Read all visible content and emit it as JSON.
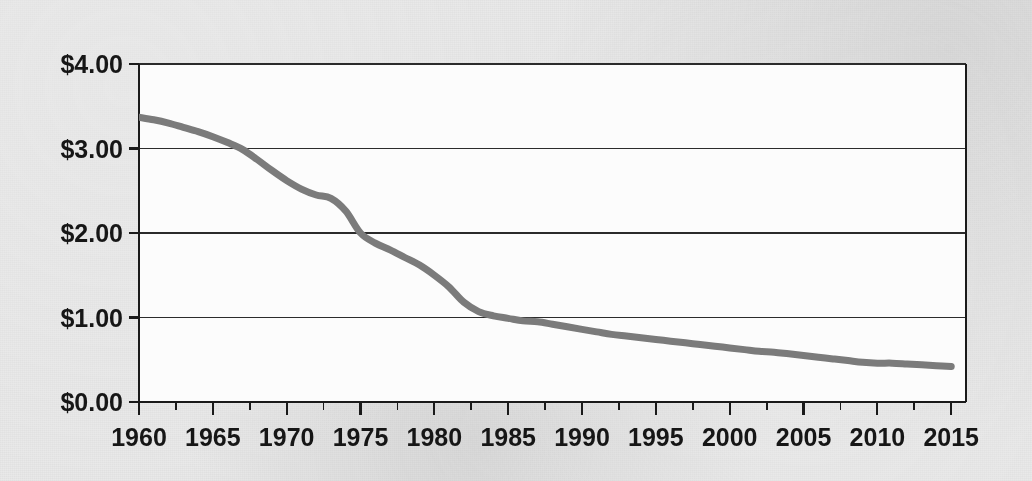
{
  "figure": {
    "background_color": "#e9e9e9",
    "plot_background_color": "#fcfcfc",
    "paper_note": "scanned-book-page"
  },
  "bleed_through": {
    "text": "a scanned page with faint text showing through from the reverse side of the paper, not legible as content in this figure, appearing only as a soft gray mottling behind the plotted chart area and its surrounding margins"
  },
  "chart_data": {
    "type": "line",
    "title": "",
    "subtitle": "",
    "xlabel": "",
    "ylabel": "",
    "grid": true,
    "grid_axis": "y",
    "legend": false,
    "legend_position": "none",
    "line_color": "#7b7b7b",
    "line_width": 7,
    "axis_color": "#1a1a1a",
    "gridline_color": "#2b2b2b",
    "xlim": [
      1960,
      2016
    ],
    "ylim": [
      0,
      4
    ],
    "y_tick_values": [
      0,
      1,
      2,
      3,
      4
    ],
    "y_tick_labels": [
      "$0.00",
      "$1.00",
      "$2.00",
      "$3.00",
      "$4.00"
    ],
    "x_tick_values": [
      1960,
      1965,
      1970,
      1975,
      1980,
      1985,
      1990,
      1995,
      2000,
      2005,
      2010,
      2015
    ],
    "x_tick_labels": [
      "1960",
      "1965",
      "1970",
      "1975",
      "1980",
      "1985",
      "1990",
      "1995",
      "2000",
      "2005",
      "2010",
      "2015"
    ],
    "x_minor_tick_values": [
      1960,
      1962.5,
      1965,
      1967.5,
      1970,
      1972.5,
      1975,
      1977.5,
      1980,
      1982.5,
      1985,
      1987.5,
      1990,
      1992.5,
      1995,
      1997.5,
      2000,
      2002.5,
      2005,
      2007.5,
      2010,
      2012.5,
      2015
    ],
    "series": [
      {
        "name": "value",
        "x": [
          1960,
          1961,
          1962,
          1963,
          1964,
          1965,
          1966,
          1967,
          1968,
          1969,
          1970,
          1971,
          1972,
          1973,
          1974,
          1975,
          1976,
          1977,
          1978,
          1979,
          1980,
          1981,
          1982,
          1983,
          1984,
          1985,
          1986,
          1987,
          1988,
          1989,
          1990,
          1991,
          1992,
          1993,
          1994,
          1995,
          1996,
          1997,
          1998,
          1999,
          2000,
          2001,
          2002,
          2003,
          2004,
          2005,
          2006,
          2007,
          2008,
          2009,
          2010,
          2011,
          2012,
          2013,
          2014,
          2015
        ],
        "y": [
          3.37,
          3.34,
          3.3,
          3.25,
          3.2,
          3.14,
          3.07,
          2.99,
          2.87,
          2.74,
          2.62,
          2.52,
          2.45,
          2.41,
          2.26,
          2.0,
          1.88,
          1.8,
          1.71,
          1.62,
          1.5,
          1.36,
          1.18,
          1.07,
          1.02,
          0.99,
          0.96,
          0.95,
          0.92,
          0.89,
          0.86,
          0.83,
          0.8,
          0.78,
          0.76,
          0.74,
          0.72,
          0.7,
          0.68,
          0.66,
          0.64,
          0.62,
          0.6,
          0.59,
          0.57,
          0.55,
          0.53,
          0.51,
          0.49,
          0.47,
          0.46,
          0.46,
          0.45,
          0.44,
          0.43,
          0.42
        ]
      }
    ],
    "annotations": [],
    "notable_points": {
      "start_year": 1960,
      "start_value": 3.37,
      "end_year": 2015,
      "end_value": 0.42,
      "crosses_3_dollars_near_year": 1968,
      "crosses_2_dollars_near_year": 1975,
      "crosses_1_dollar_near_year": 1983
    }
  }
}
